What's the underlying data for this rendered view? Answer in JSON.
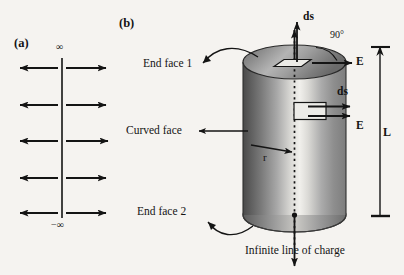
{
  "figure": {
    "background_color": "#f5f3f0",
    "ink_color": "#141414",
    "panels": [
      {
        "tag": "(a)",
        "name": "infinite-line-field-panel",
        "top_label": "∞",
        "bottom_label": "−∞",
        "arrow_rows": 5,
        "description_hidden": "vertical line with radial field arrows"
      },
      {
        "tag": "(b)",
        "name": "gaussian-cylinder-panel",
        "labels": {
          "end_face_1": "End face 1",
          "end_face_2": "End face 2",
          "curved_face": "Curved face",
          "radius": "r",
          "length": "L",
          "angle": "90°",
          "ds_top": "ds",
          "ds_side": "ds",
          "e_top": "E",
          "e_side": "E",
          "line_of_charge": "Infinite line of charge"
        }
      }
    ]
  },
  "panel_a": {
    "tag": "(a)",
    "top_infinity": "∞",
    "bottom_infinity": "−∞",
    "axis_x": 62,
    "axis_top_y": 58,
    "axis_bottom_y": 218,
    "arrow_rows_y": [
      68,
      105,
      141,
      178,
      213
    ],
    "arrow_left_tip_x": 18,
    "arrow_right_tip_x": 108
  },
  "panel_b": {
    "tag": "(b)",
    "cylinder": {
      "left_x": 243,
      "right_x": 346,
      "top_center_y": 62,
      "bottom_center_y": 215,
      "ellipse_ry": 17
    },
    "annotations": {
      "end_face_1": "End face 1",
      "end_face_2": "End face 2",
      "curved_face": "Curved face",
      "radius_symbol": "r",
      "length_symbol": "L",
      "right_angle": "90°",
      "ds_top_label": "ds",
      "e_top_label": "E",
      "ds_side_label": "ds",
      "e_side_label": "E",
      "bottom_caption": "Infinite line of charge"
    }
  },
  "colors": {
    "page_background": "#f5f3f0",
    "ink": "#141414",
    "cylinder_dark_edge": "#4f4f4f",
    "cylinder_mid": "#8f8f8f",
    "cylinder_highlight": "#f0efec",
    "cylinder_right_shade": "#878787",
    "patch_fill": "#e9e7e3",
    "top_face_fill": "#9b9b9b"
  }
}
